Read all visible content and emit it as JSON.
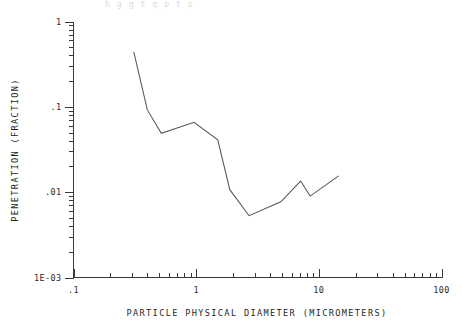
{
  "top_clipped_text": "  h    g  g    t  q  p    t    p",
  "chart_data": {
    "type": "line",
    "title": "",
    "xlabel": "PARTICLE PHYSICAL DIAMETER (MICROMETERS)",
    "ylabel": "PENETRATION (FRACTION)",
    "xscale": "log",
    "yscale": "log",
    "xlim": [
      0.1,
      100
    ],
    "ylim": [
      0.001,
      1
    ],
    "grid": false,
    "legend": null,
    "xtick_labels": [
      ".1",
      "1",
      "10",
      "100"
    ],
    "xtick_values": [
      0.1,
      1,
      10,
      100
    ],
    "ytick_labels": [
      "1",
      ".1",
      ".01",
      "1E-03"
    ],
    "ytick_values": [
      1,
      0.1,
      0.01,
      0.001
    ],
    "minor_ticks": true,
    "series": [
      {
        "name": "penetration",
        "x": [
          0.31,
          0.4,
          0.52,
          0.96,
          1.5,
          1.88,
          2.7,
          4.9,
          7.1,
          8.5,
          14.5
        ],
        "values": [
          0.44,
          0.092,
          0.049,
          0.066,
          0.041,
          0.0107,
          0.0053,
          0.0077,
          0.0135,
          0.009,
          0.0155
        ]
      }
    ]
  }
}
